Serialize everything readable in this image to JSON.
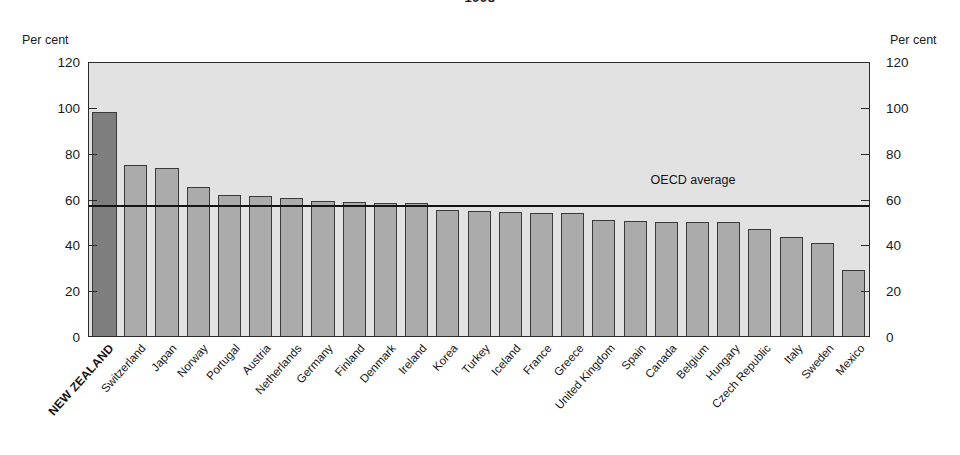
{
  "figure": {
    "title": "1998",
    "axis_unit_left": "Per cent",
    "axis_unit_right": "Per cent",
    "reference_label": "OECD average",
    "colors": {
      "highlight_bar": "#7e7e7e",
      "bar": "#ababab",
      "bar_border": "#3a3a3a",
      "plot_background": "#e2e2e2",
      "axis": "#2b2b2b",
      "reference_line": "#141414"
    }
  },
  "chart_data": {
    "type": "bar",
    "title": "1998",
    "xlabel": "",
    "ylabel": "Per cent",
    "ylim": [
      0,
      120
    ],
    "yticks": [
      0,
      20,
      40,
      60,
      80,
      100,
      120
    ],
    "ytick_labels": [
      "0",
      "20",
      "40",
      "60",
      "80",
      "100",
      "120"
    ],
    "grid": false,
    "legend": "none",
    "highlight_category": "NEW ZEALAND",
    "reference_line": {
      "label": "OECD average",
      "value": 56.5
    },
    "categories": [
      "NEW ZEALAND",
      "Switzerland",
      "Japan",
      "Norway",
      "Portugal",
      "Austria",
      "Netherlands",
      "Germany",
      "Finland",
      "Denmark",
      "Ireland",
      "Korea",
      "Turkey",
      "Iceland",
      "France",
      "Greece",
      "United Kingdom",
      "Spain",
      "Canada",
      "Belgium",
      "Hungary",
      "Czech Republic",
      "Italy",
      "Sweden",
      "Mexico"
    ],
    "values": [
      98.5,
      75.0,
      74.0,
      65.5,
      62.0,
      61.5,
      60.5,
      59.5,
      59.0,
      58.5,
      58.5,
      55.5,
      55.0,
      54.5,
      54.0,
      54.0,
      51.0,
      50.5,
      50.0,
      50.0,
      50.0,
      47.0,
      43.5,
      41.0,
      29.0
    ]
  }
}
